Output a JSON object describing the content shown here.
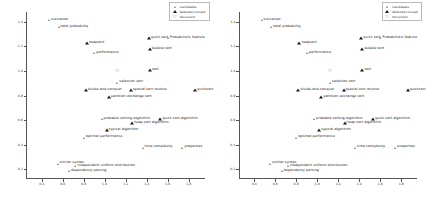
{
  "chart_data": {
    "type": "scatter",
    "title": "",
    "xlabel": "",
    "ylabel": "",
    "xlim": [
      0.25,
      1.95
    ],
    "ylim": [
      0.12,
      1.48
    ],
    "grid": false,
    "legend_position": "top-right",
    "xticks": [
      "0.4",
      "0.6",
      "0.8",
      "1.0",
      "1.2",
      "1.4",
      "1.6",
      "1.8"
    ],
    "xtick_values": [
      0.4,
      0.6,
      0.8,
      1.0,
      1.2,
      1.4,
      1.6,
      1.8
    ],
    "yticks": [
      "0.2",
      "0.4",
      "0.6",
      "0.8",
      "1.0",
      "1.2",
      "1.4"
    ],
    "ytick_values": [
      0.2,
      0.4,
      0.6,
      0.8,
      1.0,
      1.2,
      1.4
    ],
    "legend": [
      {
        "name": "Candidates",
        "marker": "triangle",
        "color": "#7a7a7a"
      },
      {
        "name": "Selected concept",
        "marker": "triangle-filled",
        "color": "#1b1b1b"
      },
      {
        "name": "Document",
        "marker": "star",
        "color": "#9a9a9a"
      }
    ],
    "points": [
      {
        "label": "successor",
        "x": 0.47,
        "y": 1.415,
        "kind": "cand"
      },
      {
        "label": "total probability",
        "x": 0.56,
        "y": 1.355,
        "kind": "cand"
      },
      {
        "label": "heapsort",
        "x": 0.83,
        "y": 1.225,
        "kind": "sel"
      },
      {
        "label": "performance",
        "x": 0.9,
        "y": 1.145,
        "kind": "cand"
      },
      {
        "label": "quick sort",
        "x": 1.42,
        "y": 1.265,
        "kind": "sel"
      },
      {
        "label": "Probabilistic feature",
        "x": 1.6,
        "y": 1.265,
        "kind": "cand"
      },
      {
        "label": "bubble sort",
        "x": 1.43,
        "y": 1.175,
        "kind": "sel"
      },
      {
        "label": "sort",
        "x": 1.43,
        "y": 1.005,
        "kind": "sel"
      },
      {
        "label": "",
        "x": 1.12,
        "y": 1.005,
        "kind": "doc"
      },
      {
        "label": "selection sort",
        "x": 1.12,
        "y": 0.905,
        "kind": "cand"
      },
      {
        "label": "divide-and-conquer",
        "x": 0.82,
        "y": 0.845,
        "kind": "sel"
      },
      {
        "label": "special sort routine",
        "x": 1.25,
        "y": 0.845,
        "kind": "sel"
      },
      {
        "label": "quicksort",
        "x": 1.86,
        "y": 0.845,
        "kind": "sel"
      },
      {
        "label": "partition exchange sort",
        "x": 1.04,
        "y": 0.785,
        "kind": "sel"
      },
      {
        "label": "probable sorting algorithm",
        "x": 0.97,
        "y": 0.605,
        "kind": "cand"
      },
      {
        "label": "heap sort algorithm",
        "x": 1.26,
        "y": 0.575,
        "kind": "sel"
      },
      {
        "label": "quick sort algorithm",
        "x": 1.53,
        "y": 0.605,
        "kind": "sel"
      },
      {
        "label": "typical algorithm",
        "x": 1.02,
        "y": 0.515,
        "kind": "sel"
      },
      {
        "label": "optimal performance",
        "x": 0.8,
        "y": 0.455,
        "kind": "cand"
      },
      {
        "label": "time complexity",
        "x": 1.36,
        "y": 0.375,
        "kind": "cand"
      },
      {
        "label": "properties",
        "x": 1.74,
        "y": 0.375,
        "kind": "cand"
      },
      {
        "label": "similar syntax",
        "x": 0.55,
        "y": 0.245,
        "kind": "cand"
      },
      {
        "label": "independent uniform distribution",
        "x": 0.72,
        "y": 0.225,
        "kind": "cand"
      },
      {
        "label": "dependency parsing",
        "x": 0.66,
        "y": 0.185,
        "kind": "cand"
      }
    ]
  },
  "panels": [
    {
      "name": "left-panel"
    },
    {
      "name": "right-panel"
    }
  ]
}
